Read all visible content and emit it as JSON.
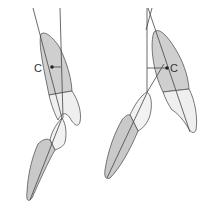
{
  "figure": {
    "panels": [
      {
        "id": "left",
        "label": "C",
        "description": "Upper tooth with axis line and vertical reference line; center of resistance C marked left of axis, lower tooth occluding below"
      },
      {
        "id": "right",
        "label": "C",
        "description": "Upper tooth with axis line and vertical reference line; center of resistance C marked right of axis, lower tooth occluding below"
      }
    ],
    "colors": {
      "root": "#cfcfcf",
      "crown": "#efefef",
      "outline": "#555555",
      "line": "#444444",
      "point": "#222222"
    }
  }
}
